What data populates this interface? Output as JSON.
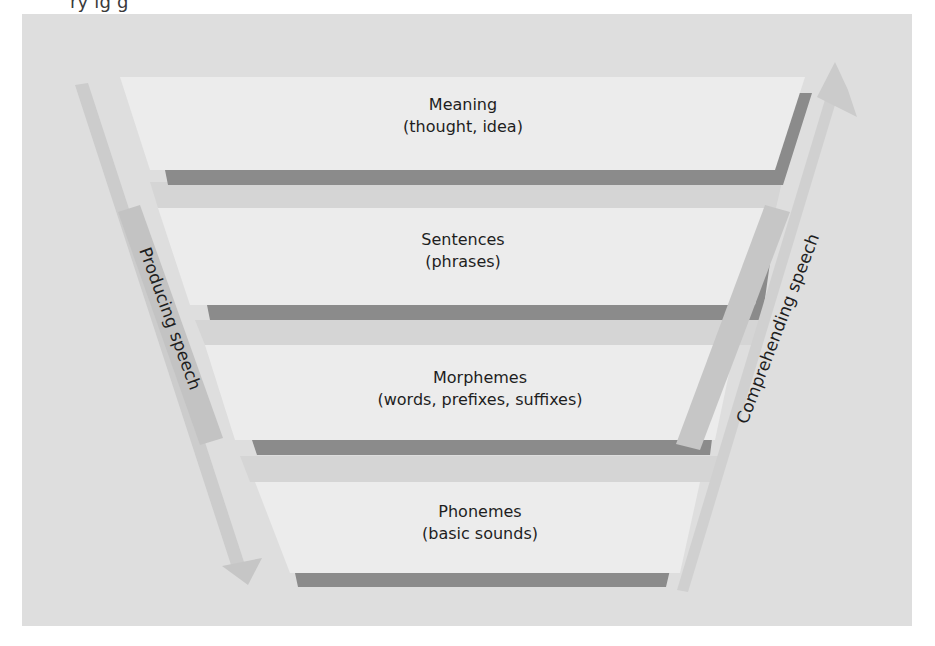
{
  "figure": {
    "top_caption_fragment": "ry ig  g",
    "background_color": "#dedede",
    "panel_color": "#ececec",
    "panel_shadow_color": "#8c8c8c",
    "band_color": "#d6d6d6",
    "arrow_color": "#cdcdcd",
    "label_box_color": "#c8c8c8"
  },
  "levels": [
    {
      "title": "Meaning",
      "subtitle": "(thought, idea)"
    },
    {
      "title": "Sentences",
      "subtitle": "(phrases)"
    },
    {
      "title": "Morphemes",
      "subtitle": "(words, prefixes, suffixes)"
    },
    {
      "title": "Phonemes",
      "subtitle": "(basic sounds)"
    }
  ],
  "arrows": {
    "left": {
      "label": "Producing speech",
      "direction": "down"
    },
    "right": {
      "label": "Comprehending speech",
      "direction": "up"
    }
  }
}
